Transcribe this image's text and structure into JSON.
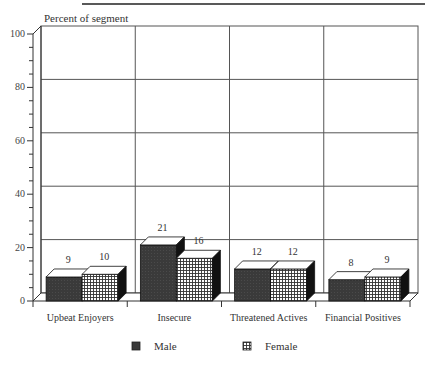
{
  "chart_data": {
    "type": "bar",
    "style": "3d-clustered",
    "title": "",
    "xlabel": "",
    "ylabel": "Percent of segment",
    "ylim": [
      0,
      100
    ],
    "yticks": [
      0,
      20,
      40,
      60,
      80,
      100
    ],
    "minor_ticks_per_major": 4,
    "grid": true,
    "legend_position": "bottom",
    "categories": [
      "Upbeat Enjoyers",
      "Insecure",
      "Threatened Actives",
      "Financial Positives"
    ],
    "series": [
      {
        "name": "Male",
        "values": [
          9,
          21,
          12,
          8
        ],
        "pattern": "solid-dark"
      },
      {
        "name": "Female",
        "values": [
          10,
          16,
          12,
          9
        ],
        "pattern": "grid-hatch"
      }
    ]
  },
  "colors": {
    "male_fill": "#3a3a3a",
    "female_fill": "#ffffff",
    "female_hatch": "#333333",
    "top_face": "#ffffff",
    "side_face": "#111111",
    "gridline": "#555555",
    "axis": "#333333"
  }
}
